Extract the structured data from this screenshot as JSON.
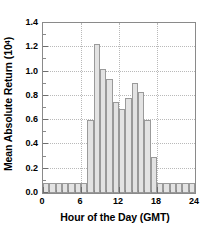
{
  "chart_data": {
    "type": "bar",
    "title": "",
    "xlabel": "Hour of the Day (GMT)",
    "ylabel_text": "Mean Absolute Return (10",
    "ylabel_exponent": "4",
    "ylabel_text_tail": ")",
    "ylabel_full": "Mean Absolute Return (10^4)",
    "xlim": [
      0,
      24
    ],
    "ylim": [
      0.0,
      1.4
    ],
    "grid": true,
    "legend": "none",
    "bin_width": 1,
    "x_major_ticks": [
      0,
      6,
      12,
      18,
      24
    ],
    "x_major_tick_labels": [
      "0",
      "6",
      "12",
      "18",
      "24"
    ],
    "x_minor_tick_step": 1,
    "y_major_ticks": [
      0.0,
      0.2,
      0.4,
      0.6,
      0.8,
      1.0,
      1.2,
      1.4
    ],
    "y_major_tick_labels": [
      "0.0",
      "0.2",
      "0.4",
      "0.6",
      "0.8",
      "1.0",
      "1.2",
      "1.4"
    ],
    "y_minor_tick_step": 0.1,
    "categories": [
      "0-1",
      "1-2",
      "2-3",
      "3-4",
      "4-5",
      "5-6",
      "6-7",
      "7-8",
      "8-9",
      "9-10",
      "10-11",
      "11-12",
      "12-13",
      "13-14",
      "14-15",
      "15-16",
      "16-17",
      "17-18",
      "18-19",
      "19-20",
      "20-21",
      "21-22",
      "22-23",
      "23-24"
    ],
    "bin_starts": [
      0,
      1,
      2,
      3,
      4,
      5,
      6,
      7,
      8,
      9,
      10,
      11,
      12,
      13,
      14,
      15,
      16,
      17,
      18,
      19,
      20,
      21,
      22,
      23
    ],
    "values": [
      0.08,
      0.08,
      0.08,
      0.08,
      0.08,
      0.08,
      0.08,
      0.6,
      1.23,
      1.02,
      0.94,
      0.75,
      0.69,
      0.78,
      0.91,
      0.83,
      0.6,
      0.3,
      0.08,
      0.08,
      0.08,
      0.08,
      0.08,
      0.08
    ],
    "colors": {
      "bar_fill": "#e3e3e3",
      "bar_edge": "#9a9a9a",
      "grid": "#b9b9b9",
      "axis": "#8a8a8a",
      "text": "#000000",
      "background": "#ffffff"
    }
  }
}
